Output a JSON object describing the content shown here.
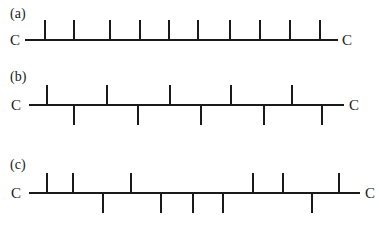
{
  "diagram": {
    "type": "polymer-chain-tacticity",
    "colors": {
      "line": "#1a1a1a",
      "background": "#ffffff"
    },
    "rows": [
      {
        "label": "(a)",
        "end_left": "C",
        "end_right": "C",
        "backbone": {
          "y": 40,
          "x1": 25,
          "x2": 338
        },
        "label_pos": {
          "x": 10,
          "y": 18
        },
        "left_c": {
          "x": 10,
          "y": 45
        },
        "right_c": {
          "x": 342,
          "y": 45
        },
        "ticks": [
          {
            "x": 45,
            "dir": "up"
          },
          {
            "x": 74,
            "dir": "up"
          },
          {
            "x": 110,
            "dir": "up"
          },
          {
            "x": 140,
            "dir": "up"
          },
          {
            "x": 169,
            "dir": "up"
          },
          {
            "x": 198,
            "dir": "up"
          },
          {
            "x": 230,
            "dir": "up"
          },
          {
            "x": 260,
            "dir": "up"
          },
          {
            "x": 290,
            "dir": "up"
          },
          {
            "x": 320,
            "dir": "up"
          }
        ]
      },
      {
        "label": "(b)",
        "end_left": "C",
        "end_right": "C",
        "backbone": {
          "y": 105,
          "x1": 29,
          "x2": 344
        },
        "label_pos": {
          "x": 10,
          "y": 81
        },
        "left_c": {
          "x": 11,
          "y": 110
        },
        "right_c": {
          "x": 349,
          "y": 110
        },
        "ticks": [
          {
            "x": 47,
            "dir": "up"
          },
          {
            "x": 74,
            "dir": "down"
          },
          {
            "x": 107,
            "dir": "up"
          },
          {
            "x": 138,
            "dir": "down"
          },
          {
            "x": 170,
            "dir": "up"
          },
          {
            "x": 201,
            "dir": "down"
          },
          {
            "x": 231,
            "dir": "up"
          },
          {
            "x": 264,
            "dir": "down"
          },
          {
            "x": 292,
            "dir": "up"
          },
          {
            "x": 322,
            "dir": "down"
          }
        ]
      },
      {
        "label": "(c)",
        "end_left": "C",
        "end_right": "C",
        "backbone": {
          "y": 193,
          "x1": 29,
          "x2": 360
        },
        "label_pos": {
          "x": 10,
          "y": 169
        },
        "left_c": {
          "x": 11,
          "y": 198
        },
        "right_c": {
          "x": 365,
          "y": 198
        },
        "ticks": [
          {
            "x": 47,
            "dir": "up"
          },
          {
            "x": 73,
            "dir": "up"
          },
          {
            "x": 103,
            "dir": "down"
          },
          {
            "x": 131,
            "dir": "up"
          },
          {
            "x": 161,
            "dir": "down"
          },
          {
            "x": 193,
            "dir": "down"
          },
          {
            "x": 223,
            "dir": "down"
          },
          {
            "x": 253,
            "dir": "up"
          },
          {
            "x": 283,
            "dir": "up"
          },
          {
            "x": 312,
            "dir": "down"
          },
          {
            "x": 339,
            "dir": "up"
          }
        ]
      }
    ],
    "tick_length": 20
  }
}
